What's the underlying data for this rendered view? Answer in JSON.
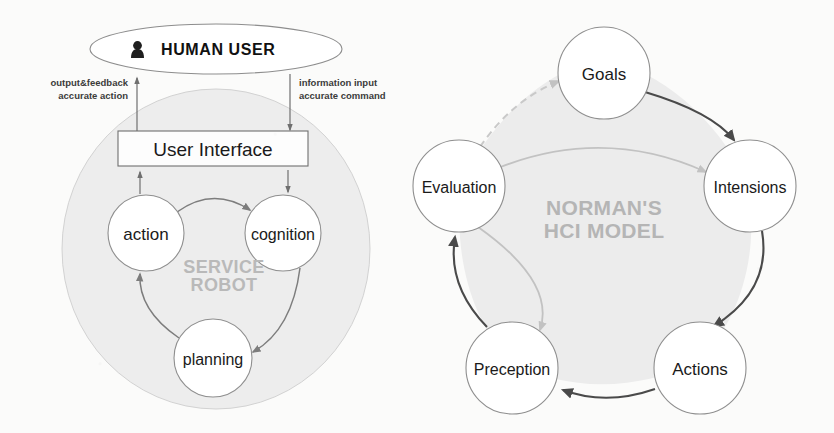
{
  "figure": {
    "background_color": "#fbfbfa",
    "panels": [
      "service-robot-hci-architecture",
      "normans-hci-model"
    ]
  },
  "left_diagram": {
    "title": "Service Robot HCI Architecture",
    "human_user": {
      "label": "HUMAN USER",
      "icon": "person-icon"
    },
    "user_interface": {
      "label": "User Interface"
    },
    "container_label_line1": "SERVICE",
    "container_label_line2": "ROBOT",
    "nodes": [
      {
        "id": "action",
        "label": "action",
        "cx": 146,
        "cy": 233,
        "r": 38
      },
      {
        "id": "cognition",
        "label": "cognition",
        "cx": 283,
        "cy": 233,
        "r": 38
      },
      {
        "id": "planning",
        "label": "planning",
        "cx": 213,
        "cy": 358,
        "r": 39
      }
    ],
    "edge_labels": [
      {
        "id": "output-feedback",
        "line1": "output&feedback",
        "line2": "accurate action",
        "align": "right"
      },
      {
        "id": "information-input",
        "line1": "information input",
        "line2": "accurate command",
        "align": "left"
      }
    ],
    "flows": [
      {
        "from": "user-interface",
        "to": "human-user",
        "direction": "up"
      },
      {
        "from": "human-user",
        "to": "user-interface",
        "direction": "down"
      },
      {
        "from": "action",
        "to": "user-interface",
        "direction": "up"
      },
      {
        "from": "user-interface",
        "to": "cognition",
        "direction": "down"
      },
      {
        "from": "action",
        "to": "cognition",
        "direction": "arc"
      },
      {
        "from": "cognition",
        "to": "planning",
        "direction": "arc"
      },
      {
        "from": "planning",
        "to": "action",
        "direction": "arc"
      }
    ],
    "colors": {
      "robot_fill": "#ededed",
      "node_fill": "#ffffff",
      "node_stroke": "#8f8f8f",
      "arrow": "#7d7d7d",
      "watermark": "#b9b9b9"
    }
  },
  "right_diagram": {
    "title_line1": "NORMAN'S",
    "title_line2": "HCI MODEL",
    "nodes": [
      {
        "id": "goals",
        "label": "Goals",
        "cx": 604,
        "cy": 73,
        "r": 46
      },
      {
        "id": "intensions",
        "label": "Intensions",
        "cx": 750,
        "cy": 186,
        "r": 46
      },
      {
        "id": "actions",
        "label": "Actions",
        "cx": 700,
        "cy": 368,
        "r": 46
      },
      {
        "id": "preception",
        "label": "Preception",
        "cx": 512,
        "cy": 368,
        "r": 46
      },
      {
        "id": "evaluation",
        "label": "Evaluation",
        "cx": 459,
        "cy": 186,
        "r": 46
      }
    ],
    "cycle": [
      {
        "from": "goals",
        "to": "intensions",
        "style": "solid-dark"
      },
      {
        "from": "intensions",
        "to": "actions",
        "style": "solid-dark"
      },
      {
        "from": "actions",
        "to": "preception",
        "style": "solid-dark"
      },
      {
        "from": "preception",
        "to": "evaluation",
        "style": "solid-dark"
      },
      {
        "from": "evaluation",
        "to": "goals",
        "style": "dashed-light"
      },
      {
        "from": "evaluation",
        "to": "intensions",
        "style": "solid-light"
      },
      {
        "from": "evaluation",
        "to": "preception",
        "style": "solid-light"
      }
    ],
    "colors": {
      "pentagon_fill": "#ececec",
      "node_fill": "#ffffff",
      "node_stroke": "#8f8f8f",
      "arrow_dark": "#4a4a4a",
      "arrow_light": "#c2c2c2",
      "watermark": "#b5b5b5"
    }
  }
}
